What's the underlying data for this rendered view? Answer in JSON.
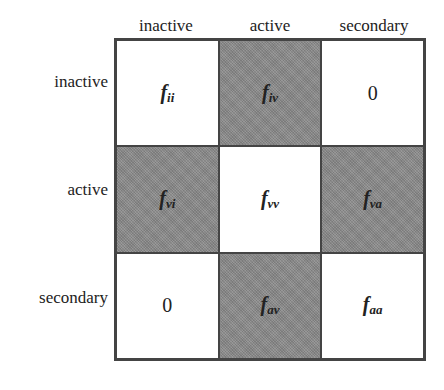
{
  "columns": [
    "inactive",
    "active",
    "secondary"
  ],
  "rows": [
    "inactive",
    "active",
    "secondary"
  ],
  "cells": [
    [
      {
        "base": "f",
        "sub": "ii",
        "shaded": false
      },
      {
        "base": "f",
        "sub": "iv",
        "shaded": true
      },
      {
        "base": "0",
        "sub": "",
        "shaded": false
      }
    ],
    [
      {
        "base": "f",
        "sub": "vi",
        "shaded": true
      },
      {
        "base": "f",
        "sub": "vv",
        "shaded": false
      },
      {
        "base": "f",
        "sub": "va",
        "shaded": true
      }
    ],
    [
      {
        "base": "0",
        "sub": "",
        "shaded": false
      },
      {
        "base": "f",
        "sub": "av",
        "shaded": true
      },
      {
        "base": "f",
        "sub": "aa",
        "shaded": false
      }
    ]
  ],
  "colors": {
    "shaded": "#8c8c8c",
    "unshaded": "#ffffff",
    "border": "#444444"
  }
}
